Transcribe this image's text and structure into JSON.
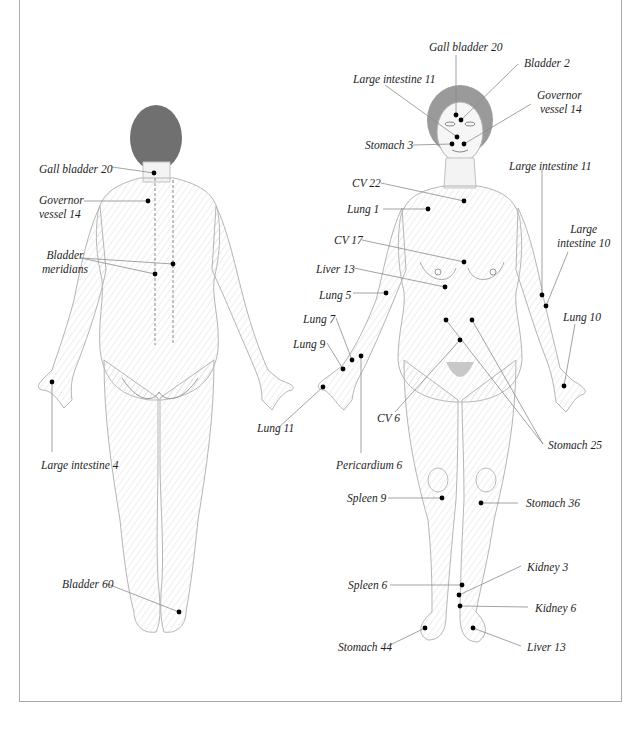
{
  "figure": {
    "type": "acupressure point anatomical illustration",
    "views": [
      "back view",
      "front view"
    ]
  },
  "back_view": {
    "labels": [
      {
        "id": "gb20",
        "text": "Gall bladder 20",
        "x": 39,
        "y": 162,
        "align": "l",
        "dot": [
          154,
          173
        ],
        "line_from": [
          112,
          167
        ]
      },
      {
        "id": "gv14",
        "text": "Governor\nvessel 14",
        "x": 39,
        "y": 193,
        "align": "l",
        "dot": [
          148,
          201
        ],
        "line_from": [
          84,
          201
        ]
      },
      {
        "id": "bladder-meridians",
        "text": "Bladder\nmeridians",
        "x": 42,
        "y": 248,
        "align": "c",
        "dots": [
          [
            173,
            264
          ],
          [
            155,
            274
          ]
        ],
        "line_from": [
          81,
          258
        ]
      },
      {
        "id": "li4",
        "text": "Large intestine 4",
        "x": 41,
        "y": 458,
        "align": "l",
        "dot": [
          52,
          382
        ],
        "line_from": [
          52,
          452
        ]
      },
      {
        "id": "bl60",
        "text": "Bladder 60",
        "x": 62,
        "y": 577,
        "align": "l",
        "dot": [
          179,
          612
        ],
        "line_from": [
          105,
          583
        ]
      }
    ]
  },
  "front_view": {
    "labels": [
      {
        "id": "gb20-front",
        "text": "Gall bladder 20",
        "x": 429,
        "y": 40,
        "align": "l",
        "dot": [
          456,
          115
        ],
        "line_from": [
          456,
          55
        ]
      },
      {
        "id": "bl2",
        "text": "Bladder 2",
        "x": 524,
        "y": 56,
        "align": "l",
        "dot": [
          461,
          120
        ],
        "line_from": [
          518,
          64
        ]
      },
      {
        "id": "li11-face",
        "text": "Large intestine 11",
        "x": 353,
        "y": 72,
        "align": "l",
        "dot": [
          457,
          137
        ],
        "line_from": [
          385,
          85
        ]
      },
      {
        "id": "gv14-front",
        "text": "Governor\nvessel 14",
        "x": 537,
        "y": 88,
        "align": "r",
        "dot": [
          464,
          144
        ],
        "line_from": [
          531,
          104
        ]
      },
      {
        "id": "st3",
        "text": "Stomach 3",
        "x": 365,
        "y": 138,
        "align": "l",
        "dot": [
          452,
          144
        ],
        "line_from": [
          413,
          145
        ]
      },
      {
        "id": "cv22",
        "text": "CV 22",
        "x": 352,
        "y": 176,
        "align": "l",
        "dot": [
          464,
          201
        ],
        "line_from": [
          381,
          183
        ]
      },
      {
        "id": "lung1",
        "text": "Lung 1",
        "x": 347,
        "y": 202,
        "align": "l",
        "dot": [
          428,
          209
        ],
        "line_from": [
          383,
          209
        ]
      },
      {
        "id": "li11-arm",
        "text": "Large intestine 11",
        "x": 509,
        "y": 159,
        "align": "l",
        "dot": [
          542,
          295
        ],
        "line_from": [
          542,
          170
        ]
      },
      {
        "id": "li10",
        "text": "Large\nintestine 10",
        "x": 557,
        "y": 222,
        "align": "c",
        "dot": [
          546,
          306
        ],
        "line_from": [
          568,
          252
        ]
      },
      {
        "id": "cv17",
        "text": "CV 17",
        "x": 334,
        "y": 233,
        "align": "l",
        "dot": [
          464,
          262
        ],
        "line_from": [
          362,
          240
        ]
      },
      {
        "id": "liver13-chest",
        "text": "Liver 13",
        "x": 316,
        "y": 262,
        "align": "l",
        "dot": [
          445,
          287
        ],
        "line_from": [
          354,
          268
        ]
      },
      {
        "id": "lung5",
        "text": "Lung 5",
        "x": 319,
        "y": 288,
        "align": "l",
        "dot": [
          386,
          293
        ],
        "line_from": [
          353,
          293
        ]
      },
      {
        "id": "lung10",
        "text": "Lung 10",
        "x": 563,
        "y": 310,
        "align": "l",
        "dot": [
          564,
          386
        ],
        "line_from": [
          575,
          324
        ]
      },
      {
        "id": "lung7",
        "text": "Lung 7",
        "x": 303,
        "y": 312,
        "align": "l",
        "dot": [
          352,
          360
        ],
        "line_from": [
          336,
          318
        ]
      },
      {
        "id": "lung9",
        "text": "Lung 9",
        "x": 293,
        "y": 337,
        "align": "l",
        "dot": [
          343,
          369
        ],
        "line_from": [
          327,
          343
        ]
      },
      {
        "id": "pericardium6",
        "text": "Pericardium 6",
        "x": 336,
        "y": 458,
        "align": "l",
        "dot": [
          361,
          356
        ],
        "line_from": [
          361,
          453
        ]
      },
      {
        "id": "lung11",
        "text": "Lung 11",
        "x": 257,
        "y": 421,
        "align": "l",
        "dot": [
          323,
          387
        ],
        "line_from": [
          278,
          428
        ]
      },
      {
        "id": "st25",
        "text": "Stomach 25",
        "x": 548,
        "y": 438,
        "align": "l",
        "dots": [
          [
            446,
            320
          ],
          [
            472,
            320
          ]
        ],
        "line_from": [
          543,
          444
        ]
      },
      {
        "id": "cv6",
        "text": "CV 6",
        "x": 377,
        "y": 411,
        "align": "l",
        "dot": [
          460,
          340
        ],
        "line_from": [
          395,
          412
        ]
      },
      {
        "id": "sp9",
        "text": "Spleen 9",
        "x": 347,
        "y": 491,
        "align": "l",
        "dot": [
          442,
          498
        ],
        "line_from": [
          388,
          498
        ]
      },
      {
        "id": "st36",
        "text": "Stomach 36",
        "x": 526,
        "y": 496,
        "align": "l",
        "dot": [
          481,
          503
        ],
        "line_from": [
          518,
          503
        ]
      },
      {
        "id": "kidney3",
        "text": "Kidney 3",
        "x": 527,
        "y": 560,
        "align": "l",
        "dot": [
          459,
          595
        ],
        "line_from": [
          521,
          566
        ]
      },
      {
        "id": "sp6",
        "text": "Spleen 6",
        "x": 348,
        "y": 578,
        "align": "l",
        "dot": [
          462,
          585
        ],
        "line_from": [
          390,
          585
        ]
      },
      {
        "id": "kidney6",
        "text": "Kidney 6",
        "x": 535,
        "y": 601,
        "align": "l",
        "dot": [
          460,
          606
        ],
        "line_from": [
          528,
          607
        ]
      },
      {
        "id": "st44",
        "text": "Stomach 44",
        "x": 338,
        "y": 640,
        "align": "l",
        "dot": [
          425,
          628
        ],
        "line_from": [
          388,
          646
        ]
      },
      {
        "id": "liver13-foot",
        "text": "Liver 13",
        "x": 527,
        "y": 640,
        "align": "l",
        "dot": [
          473,
          628
        ],
        "line_from": [
          521,
          646
        ]
      }
    ]
  },
  "colors": {
    "dot": "#000000",
    "leader_line": "#8c8c8c",
    "label_text": "#1e1e1e",
    "frame_border": "#a9a9a9",
    "skin_fill": "#f4f4f4",
    "skin_stroke": "#b5b5b5",
    "hair": "#6a6a6a"
  }
}
